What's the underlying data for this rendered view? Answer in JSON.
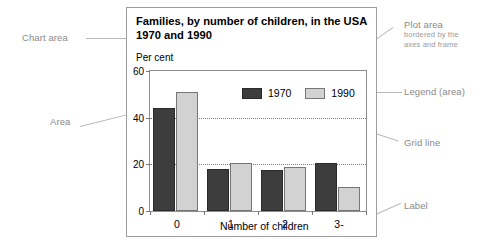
{
  "annotations": [
    {
      "id": "chart-area",
      "label": "Chart area",
      "sub": ""
    },
    {
      "id": "area",
      "label": "Area",
      "sub": ""
    },
    {
      "id": "plot-area",
      "label": "Plot area",
      "sub": "bordered by the\naxes and frame"
    },
    {
      "id": "legend-area",
      "label": "Legend (area)",
      "sub": ""
    },
    {
      "id": "grid-line",
      "label": "Grid line",
      "sub": ""
    },
    {
      "id": "label",
      "label": "Label",
      "sub": ""
    }
  ],
  "annotation_text": {
    "chart_area": "Chart area",
    "area": "Area",
    "plot_area": "Plot area",
    "plot_area_sub_line1": "bordered by the",
    "plot_area_sub_line2": "axes and frame",
    "legend_area": "Legend (area)",
    "grid_line": "Grid line",
    "label": "Label"
  },
  "chart_data": {
    "type": "bar",
    "title": "Families, by number of children, in the USA 1970 and 1990",
    "subtitle": "",
    "xlabel": "Number of children",
    "ylabel": "Per cent",
    "categories": [
      "0",
      "1",
      "2",
      "3-"
    ],
    "series": [
      {
        "name": "1970",
        "values": [
          44,
          18,
          17.5,
          20.5
        ],
        "color": "#3d3d3d"
      },
      {
        "name": "1990",
        "values": [
          51,
          20.5,
          19,
          10.5
        ],
        "color": "#d2d2d2"
      }
    ],
    "ylim": [
      0,
      60
    ],
    "yticks": [
      0,
      20,
      40,
      60
    ],
    "ytick_labels": [
      "0",
      "20",
      "40",
      "60"
    ],
    "gridlines": [
      20,
      40
    ],
    "grid": true,
    "legend_position": "inside top-center",
    "legend_entries": [
      "1970",
      "1990"
    ]
  },
  "colors": {
    "series_1970": "#3d3d3d",
    "series_1990": "#d2d2d2",
    "annotation_text": "#8a8a8a",
    "leader_line": "#b9b9b9",
    "frame": "#9d9d9d",
    "background": "#ffffff"
  }
}
